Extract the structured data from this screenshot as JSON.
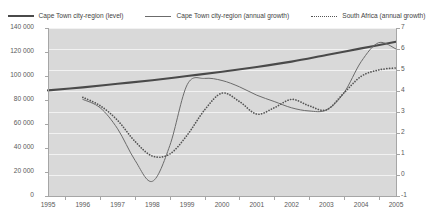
{
  "chart_data": {
    "type": "line",
    "title": "",
    "xlabel": "",
    "ylabel": "",
    "y2label": "",
    "grid": true,
    "legend_position": "top",
    "x": [
      1995,
      1996,
      1997,
      1998,
      1999,
      2000,
      2001,
      2002,
      2003,
      2004,
      2005
    ],
    "xlim": [
      1995,
      2005
    ],
    "ylim": [
      0,
      140000
    ],
    "y2lim": [
      -1,
      7
    ],
    "yticks": [
      "0",
      "20 000",
      "40 000",
      "60 000",
      "80 000",
      "100 000",
      "120 000",
      "140 000"
    ],
    "ytick_values": [
      0,
      20000,
      40000,
      60000,
      80000,
      100000,
      120000,
      140000
    ],
    "y2ticks": [
      "-1",
      "0",
      "1",
      "2",
      "3",
      "4",
      "5",
      "6",
      "7"
    ],
    "y2tick_values": [
      -1,
      0,
      1,
      2,
      3,
      4,
      5,
      6,
      7
    ],
    "xticks": [
      "1995",
      "1996",
      "1997",
      "1998",
      "1999",
      "2000",
      "2001",
      "2002",
      "2003",
      "2004",
      "2005"
    ],
    "series": [
      {
        "name": "Cape Town city-region (level)",
        "axis": "left",
        "style": "solid-thick",
        "color": "#4a4a4a",
        "x": [
          1995,
          1996,
          1997,
          1998,
          1999,
          2000,
          2001,
          2002,
          2003,
          2004,
          2005
        ],
        "values": [
          88000,
          90500,
          93500,
          96500,
          100000,
          103500,
          107500,
          112000,
          117500,
          123000,
          128500
        ]
      },
      {
        "name": "Cape Town city-region (annual growth)",
        "axis": "right",
        "style": "solid-thin",
        "color": "#6b6b6b",
        "x": [
          1996,
          1996.5,
          1997,
          1997.5,
          1998,
          1998.5,
          1999,
          1999.5,
          2000,
          2000.5,
          2001,
          2001.5,
          2002,
          2002.5,
          2003,
          2003.5,
          2004,
          2004.5,
          2005
        ],
        "values": [
          3.6,
          3.2,
          2.2,
          0.7,
          -0.3,
          1.4,
          4.3,
          4.6,
          4.5,
          4.2,
          3.8,
          3.5,
          3.2,
          3.05,
          3.1,
          3.9,
          5.4,
          6.3,
          6.0
        ]
      },
      {
        "name": "South Africa (annual growth)",
        "axis": "right",
        "style": "dotted",
        "color": "#555555",
        "x": [
          1996,
          1996.5,
          1997,
          1997.5,
          1998,
          1998.5,
          1999,
          1999.5,
          2000,
          2000.5,
          2001,
          2001.5,
          2002,
          2002.5,
          2003,
          2003.5,
          2004,
          2004.5,
          2005
        ],
        "values": [
          3.7,
          3.3,
          2.6,
          1.6,
          0.9,
          1.0,
          1.9,
          3.1,
          3.9,
          3.5,
          2.9,
          3.2,
          3.6,
          3.3,
          3.1,
          3.9,
          4.7,
          5.0,
          5.1
        ]
      }
    ]
  },
  "legend": {
    "items": [
      {
        "label": "Cape Town city-region (level)",
        "style": "sw-thick"
      },
      {
        "label": "Cape Town city-region (annual growth)",
        "style": "sw-thin"
      },
      {
        "label": "South Africa (annual growth)",
        "style": "sw-dot"
      }
    ]
  }
}
